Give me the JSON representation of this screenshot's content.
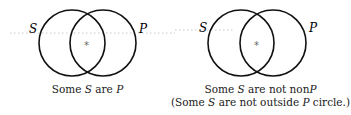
{
  "diagrams": [
    {
      "id": "some-s-are-p",
      "circles": [
        {
          "label": "S",
          "cx": 72,
          "cy": 43,
          "r": 33
        },
        {
          "label": "P",
          "cx": 103,
          "cy": 43,
          "r": 33
        }
      ],
      "mark": {
        "symbol": "*",
        "x": 87,
        "y": 46
      },
      "caption": [
        "Some S are P"
      ]
    },
    {
      "id": "some-s-are-not-nonp",
      "circles": [
        {
          "label": "S",
          "cx": 241,
          "cy": 43,
          "r": 33
        },
        {
          "label": "P",
          "cx": 273,
          "cy": 43,
          "r": 33
        }
      ],
      "mark": {
        "symbol": "*",
        "x": 257,
        "y": 46
      },
      "caption": [
        "Some S are not nonP",
        "(Some S are not outside P circle.)"
      ]
    }
  ],
  "labels": {
    "s": "S",
    "p": "P",
    "star": "*",
    "cap1_pre": "Some ",
    "cap1_post": " are ",
    "cap2a_pre": "Some ",
    "cap2a_mid": " are not non",
    "cap2b_pre": "(Some ",
    "cap2b_mid": " are not outside ",
    "cap2b_post": " circle.)"
  },
  "colors": {
    "stroke": "#111111",
    "dots": "#b8b8b8",
    "text": "#1a1a1a"
  }
}
